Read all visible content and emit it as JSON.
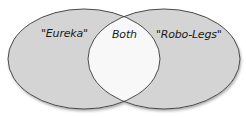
{
  "diagram": {
    "type": "venn",
    "sets": [
      {
        "id": "left",
        "label": "\"Eureka\""
      },
      {
        "id": "right",
        "label": "\"Robo-Legs\""
      }
    ],
    "intersection": {
      "label": "Both"
    },
    "colors": {
      "set_fill": "#d4d4d4",
      "intersection_fill": "#f8f8f8",
      "stroke": "#4a4a4a",
      "shadow": "#9a9a9a",
      "text": "#1a1a1a"
    }
  }
}
